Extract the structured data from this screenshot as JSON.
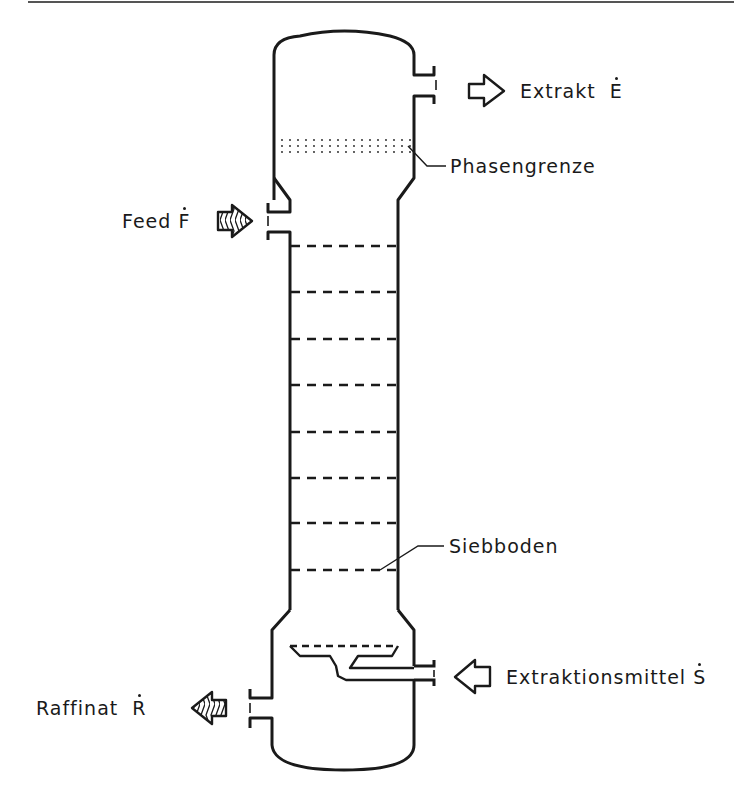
{
  "diagram": {
    "type": "sieve-tray extraction column",
    "colors": {
      "line": "#1a1a1a",
      "background": "#ffffff",
      "rule": "#555555"
    },
    "labels": {
      "extract": {
        "text": "Extrakt",
        "symbol": "E"
      },
      "interface": {
        "text": "Phasengrenze"
      },
      "feed": {
        "text": "Feed",
        "symbol": "F"
      },
      "sieve_tray": {
        "text": "Siebboden"
      },
      "solvent": {
        "text": "Extraktionsmittel",
        "symbol": "S"
      },
      "raffinate": {
        "text": "Raffinat",
        "symbol": "R"
      }
    },
    "streams": [
      {
        "name": "Extrakt",
        "direction": "out",
        "side": "right",
        "arrow": "hollow"
      },
      {
        "name": "Feed",
        "direction": "in",
        "side": "left",
        "arrow": "hatched"
      },
      {
        "name": "Extraktionsmittel",
        "direction": "in",
        "side": "right",
        "arrow": "hollow"
      },
      {
        "name": "Raffinat",
        "direction": "out",
        "side": "left",
        "arrow": "hatched"
      }
    ],
    "tray_count": 8
  }
}
